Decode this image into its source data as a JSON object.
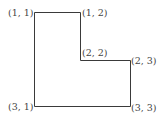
{
  "diagram": {
    "type": "L-shaped polygon grid coordinates",
    "stroke_color": "#3a3a3a",
    "label_color": "#444444",
    "vertices": [
      {
        "id": "v11",
        "label": "(1, 1)",
        "x": 34,
        "y": 12
      },
      {
        "id": "v12",
        "label": "(1, 2)",
        "x": 80,
        "y": 12
      },
      {
        "id": "v22",
        "label": "(2, 2)",
        "x": 80,
        "y": 60
      },
      {
        "id": "v23",
        "label": "(2, 3)",
        "x": 130,
        "y": 60
      },
      {
        "id": "v33",
        "label": "(3, 3)",
        "x": 130,
        "y": 106
      },
      {
        "id": "v31",
        "label": "(3, 1)",
        "x": 34,
        "y": 106
      }
    ],
    "labels": {
      "v11": "(1, 1)",
      "v12": "(1, 2)",
      "v22": "(2, 2)",
      "v23": "(2, 3)",
      "v33": "(3, 3)",
      "v31": "(3, 1)"
    }
  }
}
